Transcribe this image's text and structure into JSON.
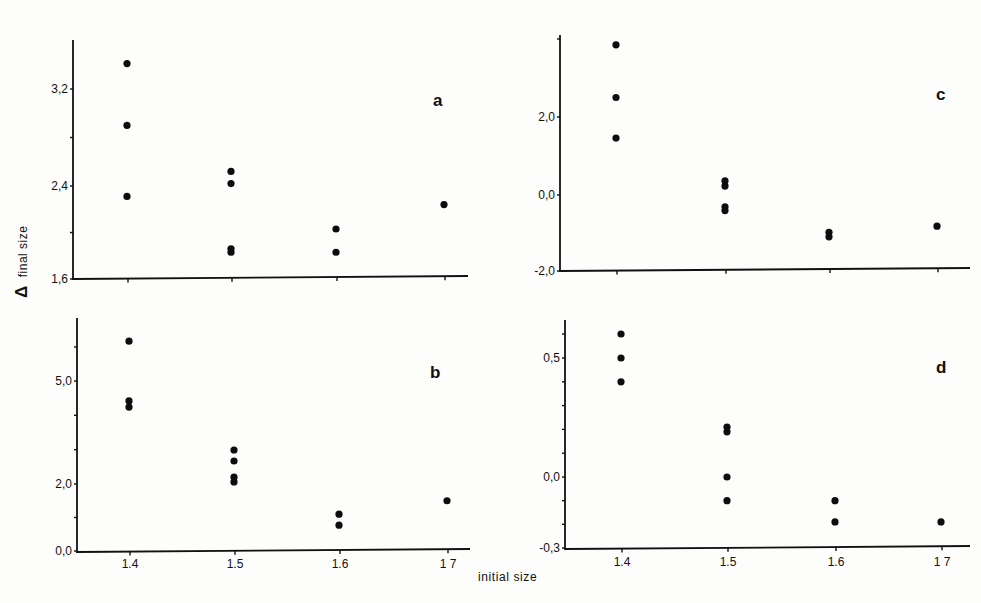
{
  "figure": {
    "y_axis_label_symbol": "Δ",
    "y_axis_label_text": "final size",
    "x_axis_label": "initial size"
  },
  "chart_data": [
    {
      "type": "scatter",
      "panel": "a",
      "title": "",
      "xlabel": "initial size",
      "ylabel": "Δ final size",
      "x_ticks": [
        1.4,
        1.5,
        1.6,
        1.7
      ],
      "x_tick_labels_shown": false,
      "y_tick_labels": [
        "1,6",
        "2,4",
        "3,2"
      ],
      "y_ticks": [
        1.6,
        2.0,
        2.4,
        2.8,
        3.2
      ],
      "ylim": [
        1.6,
        3.6
      ],
      "grid": false,
      "points": [
        {
          "x": 1.4,
          "y": 3.41
        },
        {
          "x": 1.4,
          "y": 2.9
        },
        {
          "x": 1.4,
          "y": 2.31
        },
        {
          "x": 1.5,
          "y": 2.52
        },
        {
          "x": 1.5,
          "y": 2.42
        },
        {
          "x": 1.5,
          "y": 1.86
        },
        {
          "x": 1.5,
          "y": 1.83
        },
        {
          "x": 1.6,
          "y": 2.03
        },
        {
          "x": 1.6,
          "y": 1.83
        },
        {
          "x": 1.7,
          "y": 2.24
        }
      ]
    },
    {
      "type": "scatter",
      "panel": "c",
      "title": "",
      "xlabel": "initial size",
      "ylabel": "Δ final size",
      "x_ticks": [
        1.4,
        1.5,
        1.6,
        1.7
      ],
      "x_tick_labels_shown": false,
      "y_tick_labels": [
        "-2,0",
        "0,0",
        "2,0"
      ],
      "y_ticks": [
        -2.0,
        0.0,
        2.0,
        4.0
      ],
      "ylim": [
        -2.0,
        4.0
      ],
      "grid": false,
      "points": [
        {
          "x": 1.4,
          "y": 3.85
        },
        {
          "x": 1.4,
          "y": 2.5
        },
        {
          "x": 1.4,
          "y": 1.46
        },
        {
          "x": 1.5,
          "y": 0.36
        },
        {
          "x": 1.5,
          "y": 0.23
        },
        {
          "x": 1.5,
          "y": -0.31
        },
        {
          "x": 1.5,
          "y": -0.41
        },
        {
          "x": 1.6,
          "y": -0.98
        },
        {
          "x": 1.6,
          "y": -1.1
        },
        {
          "x": 1.7,
          "y": -0.82
        }
      ]
    },
    {
      "type": "scatter",
      "panel": "b",
      "title": "",
      "xlabel": "initial size",
      "ylabel": "Δ final size",
      "x_ticks": [
        1.4,
        1.5,
        1.6,
        1.7
      ],
      "x_tick_labels": [
        "1.4",
        "1.5",
        "1.6",
        "1 7"
      ],
      "y_tick_labels": [
        "0,0",
        "2,0",
        "5,0"
      ],
      "y_ticks": [
        0,
        1,
        2,
        3,
        4,
        5,
        6
      ],
      "ylim": [
        0.0,
        6.8
      ],
      "grid": false,
      "points": [
        {
          "x": 1.4,
          "y": 6.17
        },
        {
          "x": 1.4,
          "y": 4.42
        },
        {
          "x": 1.4,
          "y": 4.24
        },
        {
          "x": 1.5,
          "y": 2.99
        },
        {
          "x": 1.5,
          "y": 2.67
        },
        {
          "x": 1.5,
          "y": 2.2
        },
        {
          "x": 1.5,
          "y": 2.06
        },
        {
          "x": 1.6,
          "y": 1.1
        },
        {
          "x": 1.6,
          "y": 0.77
        },
        {
          "x": 1.7,
          "y": 1.5
        }
      ]
    },
    {
      "type": "scatter",
      "panel": "d",
      "title": "",
      "xlabel": "initial size",
      "ylabel": "Δ final size",
      "x_ticks": [
        1.4,
        1.5,
        1.6,
        1.7
      ],
      "x_tick_labels": [
        "1.4",
        "1.5",
        "1.6",
        "1 7"
      ],
      "y_tick_labels": [
        "-0,3",
        "0,0",
        "0,5"
      ],
      "y_ticks": [
        -0.3,
        -0.2,
        -0.1,
        0.0,
        0.1,
        0.2,
        0.3,
        0.4,
        0.5,
        0.6
      ],
      "ylim": [
        -0.3,
        0.7
      ],
      "grid": false,
      "points": [
        {
          "x": 1.4,
          "y": 0.6
        },
        {
          "x": 1.4,
          "y": 0.5
        },
        {
          "x": 1.4,
          "y": 0.4
        },
        {
          "x": 1.5,
          "y": 0.21
        },
        {
          "x": 1.5,
          "y": 0.19
        },
        {
          "x": 1.5,
          "y": 0.0
        },
        {
          "x": 1.5,
          "y": -0.1
        },
        {
          "x": 1.6,
          "y": -0.1
        },
        {
          "x": 1.6,
          "y": -0.19
        },
        {
          "x": 1.7,
          "y": -0.19
        }
      ]
    }
  ]
}
